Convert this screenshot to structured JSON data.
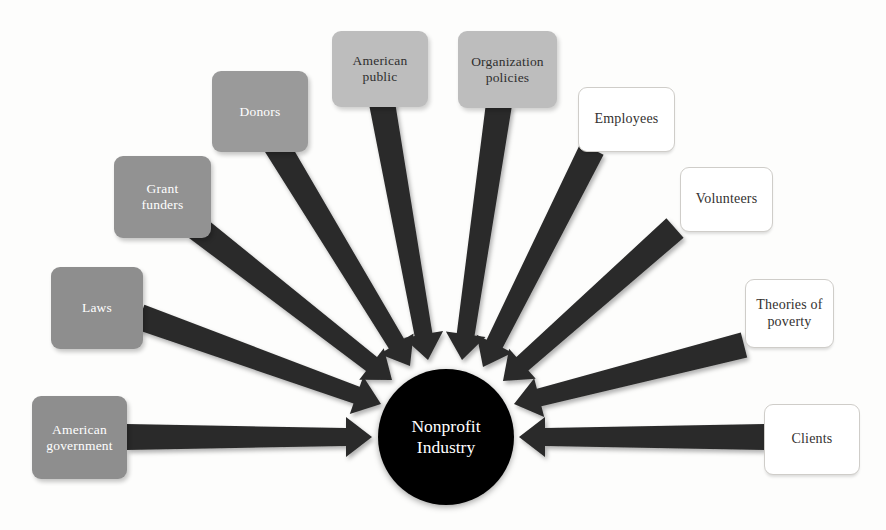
{
  "diagram": {
    "type": "radial-convergence",
    "title_visible": false,
    "background_color": "#fdfdfc",
    "arrow_color": "#2b2b2b",
    "center": {
      "label": "Nonprofit\nIndustry",
      "shape": "circle",
      "fill_color": "#000000",
      "text_color": "#ffffff",
      "cx": 446,
      "cy": 437,
      "r": 68
    },
    "nodes": [
      {
        "id": "american-government",
        "label": "American\ngovernment",
        "style": "dark-fill",
        "fill_color": "#8e8e8e",
        "text_color": "#ffffff",
        "x": 32,
        "y": 396,
        "w": 95,
        "h": 83,
        "arrow_from": [
          127,
          437
        ],
        "arrow_to": [
          372,
          437
        ]
      },
      {
        "id": "laws",
        "label": "Laws",
        "style": "dark-fill",
        "fill_color": "#8e8e8e",
        "text_color": "#ffffff",
        "x": 51,
        "y": 267,
        "w": 92,
        "h": 82,
        "arrow_from": [
          140,
          317
        ],
        "arrow_to": [
          381,
          404
        ]
      },
      {
        "id": "grant-funders",
        "label": "Grant\nfunders",
        "style": "dark-fill",
        "fill_color": "#929292",
        "text_color": "#ffffff",
        "x": 114,
        "y": 156,
        "w": 97,
        "h": 82,
        "arrow_from": [
          196,
          227
        ],
        "arrow_to": [
          392,
          380
        ]
      },
      {
        "id": "donors",
        "label": "Donors",
        "style": "dark-fill",
        "fill_color": "#9a9a9a",
        "text_color": "#ffffff",
        "x": 212,
        "y": 71,
        "w": 96,
        "h": 81,
        "arrow_from": [
          276,
          145
        ],
        "arrow_to": [
          410,
          366
        ]
      },
      {
        "id": "american-public",
        "label": "American\npublic",
        "style": "light-fill",
        "fill_color": "#bdbdbd",
        "text_color": "#2f2f2f",
        "x": 332,
        "y": 31,
        "w": 96,
        "h": 76,
        "arrow_from": [
          382,
          103
        ],
        "arrow_to": [
          428,
          360
        ]
      },
      {
        "id": "organization-policies",
        "label": "Organization\npolicies",
        "style": "light-fill",
        "fill_color": "#bdbdbd",
        "text_color": "#2f2f2f",
        "x": 458,
        "y": 31,
        "w": 99,
        "h": 77,
        "arrow_from": [
          499,
          104
        ],
        "arrow_to": [
          462,
          360
        ]
      },
      {
        "id": "employees",
        "label": "Employees",
        "style": "white-fill",
        "fill_color": "#ffffff",
        "text_color": "#33312f",
        "x": 578,
        "y": 87,
        "w": 97,
        "h": 65,
        "arrow_from": [
          592,
          149
        ],
        "arrow_to": [
          483,
          367
        ]
      },
      {
        "id": "volunteers",
        "label": "Volunteers",
        "style": "white-fill",
        "fill_color": "#ffffff",
        "text_color": "#33312f",
        "x": 680,
        "y": 167,
        "w": 93,
        "h": 65,
        "arrow_from": [
          675,
          228
        ],
        "arrow_to": [
          503,
          381
        ]
      },
      {
        "id": "theories-of-poverty",
        "label": "Theories of\npoverty",
        "style": "white-fill",
        "fill_color": "#ffffff",
        "text_color": "#33312f",
        "x": 745,
        "y": 279,
        "w": 89,
        "h": 69,
        "arrow_from": [
          744,
          345
        ],
        "arrow_to": [
          514,
          404
        ]
      },
      {
        "id": "clients",
        "label": "Clients",
        "style": "white-fill",
        "fill_color": "#ffffff",
        "text_color": "#33312f",
        "x": 764,
        "y": 404,
        "w": 96,
        "h": 71,
        "arrow_from": [
          764,
          437
        ],
        "arrow_to": [
          519,
          437
        ]
      }
    ]
  }
}
